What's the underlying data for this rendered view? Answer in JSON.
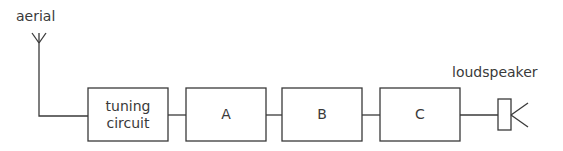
{
  "diagram": {
    "type": "block-diagram",
    "title": "",
    "aerial_label": "aerial",
    "loudspeaker_label": "loudspeaker",
    "blocks": [
      {
        "id": "tuning",
        "label_line1": "tuning",
        "label_line2": "circuit"
      },
      {
        "id": "A",
        "label": "A"
      },
      {
        "id": "B",
        "label": "B"
      },
      {
        "id": "C",
        "label": "C"
      }
    ],
    "connections": [
      [
        "aerial",
        "tuning"
      ],
      [
        "tuning",
        "A"
      ],
      [
        "A",
        "B"
      ],
      [
        "B",
        "C"
      ],
      [
        "C",
        "loudspeaker"
      ]
    ],
    "line_color": "#3a3a3a"
  }
}
